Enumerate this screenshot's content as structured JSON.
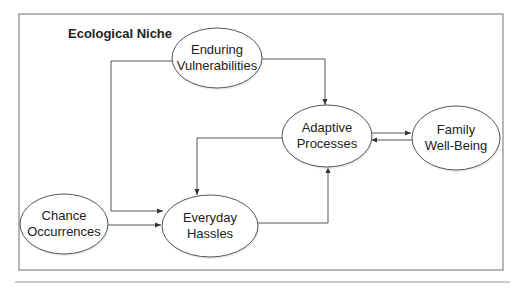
{
  "diagram": {
    "frame_title": "Ecological Niche",
    "nodes": [
      {
        "id": "enduring",
        "lines": [
          "Enduring",
          "Vulnerabilities"
        ],
        "cx": 217,
        "cy": 58,
        "rx": 45,
        "ry": 30
      },
      {
        "id": "adaptive",
        "lines": [
          "Adaptive",
          "Processes"
        ],
        "cx": 327,
        "cy": 136,
        "rx": 45,
        "ry": 31
      },
      {
        "id": "family",
        "lines": [
          "Family",
          "Well-Being"
        ],
        "cx": 456,
        "cy": 138,
        "rx": 44,
        "ry": 32
      },
      {
        "id": "chance",
        "lines": [
          "Chance",
          "Occurrences"
        ],
        "cx": 64,
        "cy": 224,
        "rx": 44,
        "ry": 30
      },
      {
        "id": "everyday",
        "lines": [
          "Everyday",
          "Hassles"
        ],
        "cx": 210,
        "cy": 226,
        "rx": 48,
        "ry": 31
      }
    ],
    "edges": [
      {
        "from": "enduring",
        "to": "everyday"
      },
      {
        "from": "enduring",
        "to": "adaptive"
      },
      {
        "from": "adaptive",
        "to": "everyday"
      },
      {
        "from": "everyday",
        "to": "adaptive"
      },
      {
        "from": "adaptive",
        "to": "family"
      },
      {
        "from": "family",
        "to": "adaptive"
      },
      {
        "from": "chance",
        "to": "everyday"
      }
    ],
    "colors": {
      "stroke": "#555555",
      "frame": "#777777",
      "text": "#222222"
    }
  }
}
